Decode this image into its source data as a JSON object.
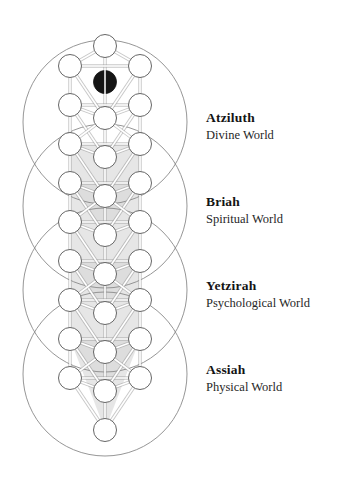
{
  "page": {
    "background_color": "#ffffff",
    "width": 348,
    "height": 484
  },
  "diagram": {
    "name": "jacobs-ladder-tree-of-life",
    "type": "kabbalistic-tree-diagram",
    "colors": {
      "outline": "#6e6e6e",
      "great_circle_stroke": "#8a8a8a",
      "path_stroke": "#9a9a9a",
      "path_fill": "#f2f2f2",
      "node_fill": "#ffffff",
      "node_stroke": "#555555",
      "shade_fill": "#d7d7d7",
      "daath_fill": "#151515",
      "text_color": "#141414"
    },
    "geometry": {
      "center_x": 105,
      "column_x": {
        "left": 70,
        "center": 105,
        "right": 140
      },
      "node_radius": 11.5,
      "great_circle_radius": 82,
      "great_circle_centers_y": [
        122,
        206,
        290,
        374
      ]
    },
    "central_pillar_nodes_y": [
      46,
      118,
      157,
      196,
      235,
      274,
      313,
      352,
      391,
      430
    ],
    "side_nodes_y": [
      66,
      105,
      144,
      183,
      222,
      261,
      300,
      339,
      378,
      417
    ],
    "daath": {
      "label": "daath-node",
      "cx": 105,
      "cy": 82,
      "r": 11.5,
      "filled": true
    },
    "node_count": {
      "center_column": 10,
      "left_column": 9,
      "right_column": 9,
      "daath": 1
    }
  },
  "worlds": [
    {
      "id": "atziluth",
      "name": "Atziluth",
      "subtitle": "Divine World",
      "label_top": 110
    },
    {
      "id": "briah",
      "name": "Briah",
      "subtitle": "Spiritual World",
      "label_top": 194
    },
    {
      "id": "yetzirah",
      "name": "Yetzirah",
      "subtitle": "Psychological World",
      "label_top": 278
    },
    {
      "id": "assiah",
      "name": "Assiah",
      "subtitle": "Physical World",
      "label_top": 362
    }
  ],
  "chart_data": {
    "type": "diagram",
    "categories": [
      "Atziluth",
      "Briah",
      "Yetzirah",
      "Assiah"
    ],
    "values": [
      "Divine World",
      "Spiritual World",
      "Psychological World",
      "Physical World"
    ]
  }
}
